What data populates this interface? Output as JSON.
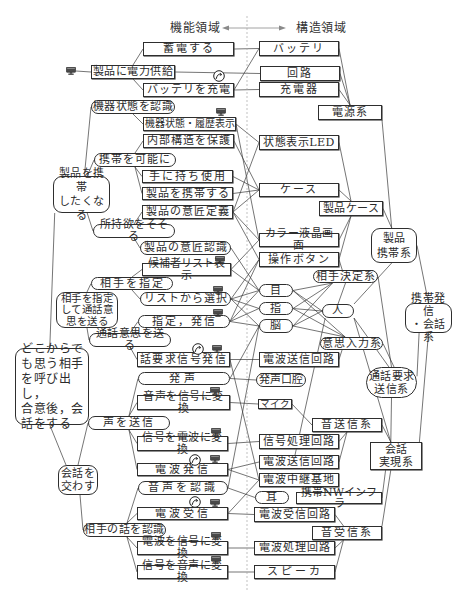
{
  "header": {
    "function_domain": "機能領域",
    "structure_domain": "構造領域"
  },
  "icons": {
    "device_display": "monitor-icon",
    "rotation": "cycle-icon"
  },
  "nodes": {
    "f_power": "製品に電力供給",
    "f_store": "蓄電する",
    "f_charge": "バッテリを充電",
    "f_recognize_state": "機器状態を認識",
    "f_show_state": "機器状態・履歴表示",
    "f_protect": "内部構造を保護",
    "f_portable": "携帯を可能に",
    "f_want_carry": "製品を携帯\nしたくなる",
    "f_hold": "手に持ち使用",
    "f_carry": "製品を携帯する",
    "f_design_def": "製品の意匠定義",
    "f_desire": "所持欲をそそる",
    "f_design_rec": "製品の意匠認識",
    "f_candidate": "候補者リスト表示",
    "f_specify": "相手を指定",
    "f_specify_send": "相手を指定\nして通話意\n思を送る",
    "f_select": "リストから選択",
    "f_dial": "指定，発信",
    "f_send_intent": "通話意思を送る",
    "f_root": "どこからで\nも思う相手\nを呼び出し，\n合意後，会\n話をする",
    "f_call_signal": "話要求信号発信",
    "f_utter": "発声",
    "f_voice_to_signal": "音声を信号に変換",
    "f_send_voice": "声を送信",
    "f_signal_to_wave": "信号を電波に変換",
    "f_converse": "会話を\n交わす",
    "f_emit": "電波発信",
    "f_recog_voice": "音声を認識",
    "f_receive": "電波受信",
    "f_recog_other": "相手の話を認識",
    "f_wave_to_signal": "電波を信号に変換",
    "f_signal_to_voice": "信号を音声に変換",
    "s_battery": "バッテリ",
    "s_circuit": "回路",
    "s_charger": "充電器",
    "s_power_sys": "電源系",
    "s_led": "状態表示LED",
    "s_case": "ケース",
    "s_product_case": "製品ケース",
    "s_portable_sys": "製品\n携帯系",
    "s_lcd": "カラー液晶画面",
    "s_button": "操作ボタン",
    "s_partner_sys": "相手決定系",
    "s_eye": "目",
    "s_call_sys": "携帯発信\n・会話系",
    "s_finger": "指",
    "s_person": "人",
    "s_brain": "脳",
    "s_intent_sys": "意思入力系",
    "s_tx_circuit1": "電波送信回路",
    "s_mouth": "発声口腔",
    "s_request_sys": "通話要求\n送信系",
    "s_mic": "マイク",
    "s_voice_tx_sys": "音送信系",
    "s_signal_proc": "信号処理回路",
    "s_conv_sys": "会話\n実現系",
    "s_tx_circuit2": "電波送信回路",
    "s_relay": "電波中継基地",
    "s_ear": "耳",
    "s_nw_infra": "携帯NWインフラ",
    "s_rx_circuit": "電波受信回路",
    "s_voice_rx_sys": "音受信系",
    "s_wave_proc": "電波処理回路",
    "s_speaker": "スピーカ"
  },
  "edges": [
    [
      "f_power",
      "f_store",
      "t@0.5",
      "l"
    ],
    [
      "f_power",
      "f_charge",
      "b@0.5",
      "l"
    ],
    [
      "f_recognize_state",
      "f_show_state",
      "b@0.5",
      "l"
    ],
    [
      "f_portable",
      "f_protect",
      "t@0.5",
      "l"
    ],
    [
      "f_portable",
      "f_hold",
      "b@0.5",
      "l"
    ],
    [
      "f_portable",
      "f_carry",
      "b@0.5",
      "l"
    ],
    [
      "f_desire",
      "f_design_def",
      "t@0.5",
      "l"
    ],
    [
      "f_desire",
      "f_design_rec",
      "b@0.5",
      "l"
    ],
    [
      "f_want_carry",
      "f_recognize_state",
      "t@0.55",
      "l"
    ],
    [
      "f_want_carry",
      "f_portable",
      "t@0.6",
      "l"
    ],
    [
      "f_want_carry",
      "f_desire",
      "b@0.6",
      "l"
    ],
    [
      "f_want_carry",
      "f_root",
      "b@0.03",
      "t@0.47"
    ],
    [
      "f_specify_send",
      "f_specify",
      "t@0.5",
      "l"
    ],
    [
      "f_specify_send",
      "f_send_intent",
      "b@0.5",
      "l"
    ],
    [
      "f_specify",
      "f_candidate",
      "t@0.5",
      "l"
    ],
    [
      "f_specify",
      "f_select",
      "b@0.5",
      "l"
    ],
    [
      "f_send_intent",
      "f_dial",
      "t@0.5",
      "l"
    ],
    [
      "f_send_intent",
      "f_call_signal",
      "b@0.5",
      "l"
    ],
    [
      "f_root",
      "f_converse",
      "b@0.47",
      "t@0.2"
    ],
    [
      "f_converse",
      "f_send_voice",
      "t@0.5",
      "l"
    ],
    [
      "f_converse",
      "f_recog_other",
      "b@0.55",
      "l"
    ],
    [
      "f_send_voice",
      "f_utter",
      "t@0.5",
      "l"
    ],
    [
      "f_send_voice",
      "f_voice_to_signal",
      "t@0.5",
      "l"
    ],
    [
      "f_send_voice",
      "f_signal_to_wave",
      "b@0.5",
      "l"
    ],
    [
      "f_send_voice",
      "f_emit",
      "b@0.5",
      "l"
    ],
    [
      "f_recog_other",
      "f_recog_voice",
      "t@0.53",
      "l"
    ],
    [
      "f_recog_other",
      "f_receive",
      "t@0.53",
      "l"
    ],
    [
      "f_recog_other",
      "f_wave_to_signal",
      "b@0.53",
      "l"
    ],
    [
      "f_recog_other",
      "f_signal_to_voice",
      "b@0.53",
      "l"
    ],
    [
      "icon_power_monitor",
      "f_power",
      "r",
      "l"
    ],
    [
      "f_store",
      "s_battery"
    ],
    [
      "f_power",
      "s_circuit"
    ],
    [
      "f_charge",
      "s_battery"
    ],
    [
      "f_charge",
      "s_charger"
    ],
    [
      "f_show_state",
      "s_led"
    ],
    [
      "f_show_state",
      "s_lcd"
    ],
    [
      "f_protect",
      "s_case"
    ],
    [
      "f_hold",
      "s_case"
    ],
    [
      "f_carry",
      "s_case"
    ],
    [
      "f_design_def",
      "s_case"
    ],
    [
      "f_design_def",
      "s_led"
    ],
    [
      "f_design_def",
      "s_lcd"
    ],
    [
      "f_design_def",
      "s_button"
    ],
    [
      "f_design_rec",
      "s_eye"
    ],
    [
      "f_candidate",
      "s_lcd"
    ],
    [
      "f_candidate",
      "s_eye"
    ],
    [
      "f_select",
      "s_button"
    ],
    [
      "f_select",
      "s_eye"
    ],
    [
      "f_select",
      "s_finger"
    ],
    [
      "f_select",
      "s_brain"
    ],
    [
      "f_dial",
      "s_button"
    ],
    [
      "f_dial",
      "s_eye"
    ],
    [
      "f_dial",
      "s_finger"
    ],
    [
      "f_dial",
      "s_brain"
    ],
    [
      "f_call_signal",
      "s_tx_circuit1"
    ],
    [
      "f_call_signal",
      "s_relay"
    ],
    [
      "f_utter",
      "s_mouth"
    ],
    [
      "f_utter",
      "s_brain"
    ],
    [
      "f_voice_to_signal",
      "s_mic"
    ],
    [
      "f_signal_to_wave",
      "s_signal_proc"
    ],
    [
      "f_emit",
      "s_tx_circuit2"
    ],
    [
      "f_emit",
      "s_relay"
    ],
    [
      "f_recog_voice",
      "s_ear"
    ],
    [
      "f_recog_voice",
      "s_brain"
    ],
    [
      "f_receive",
      "s_rx_circuit"
    ],
    [
      "f_receive",
      "s_relay"
    ],
    [
      "f_wave_to_signal",
      "s_wave_proc"
    ],
    [
      "f_signal_to_voice",
      "s_speaker"
    ],
    [
      "s_battery",
      "s_power_sys",
      "r",
      "t@0.5"
    ],
    [
      "s_circuit",
      "s_power_sys",
      "r",
      "t@0.5"
    ],
    [
      "s_charger",
      "s_power_sys",
      "r",
      "t@0.5"
    ],
    [
      "s_power_sys",
      "s_portable_sys",
      "r@1",
      "t@0.45"
    ],
    [
      "s_led",
      "s_product_case",
      "r",
      "t@0.5"
    ],
    [
      "s_case",
      "s_product_case",
      "r",
      "t@0.5"
    ],
    [
      "s_lcd",
      "s_product_case",
      "r",
      "b@0.5"
    ],
    [
      "s_button",
      "s_product_case",
      "r",
      "b@0.5"
    ],
    [
      "s_product_case",
      "s_portable_sys",
      "r",
      "t@0.45"
    ],
    [
      "s_button",
      "s_partner_sys",
      "r",
      "t@0.45"
    ],
    [
      "s_eye",
      "s_partner_sys",
      "r",
      "b@0.3"
    ],
    [
      "s_finger",
      "s_partner_sys",
      "r",
      "b@0.3"
    ],
    [
      "s_brain",
      "s_partner_sys",
      "r",
      "b@0.3"
    ],
    [
      "s_eye",
      "s_intent_sys",
      "r",
      "t@0.4"
    ],
    [
      "s_finger",
      "s_intent_sys",
      "r",
      "t@0.4"
    ],
    [
      "s_brain",
      "s_intent_sys",
      "r",
      "t@0.4"
    ],
    [
      "s_eye",
      "s_person",
      "r",
      "l"
    ],
    [
      "s_finger",
      "s_person",
      "r",
      "l"
    ],
    [
      "s_brain",
      "s_person",
      "r",
      "l"
    ],
    [
      "s_person",
      "s_partner_sys",
      "t@0.5",
      "b@0.5"
    ],
    [
      "s_person",
      "s_portable_sys",
      "r@0",
      "b@0.45"
    ],
    [
      "s_person",
      "s_request_sys",
      "r@1",
      "t@0.45"
    ],
    [
      "s_person",
      "s_conv_sys",
      "r@1",
      "t@0.4"
    ],
    [
      "s_person",
      "s_tx_circuit2",
      "b@0.1",
      "t@0.45"
    ],
    [
      "s_partner_sys",
      "s_request_sys",
      "r",
      "t@0.5"
    ],
    [
      "s_intent_sys",
      "s_request_sys",
      "r",
      "t@0.55"
    ],
    [
      "s_tx_circuit1",
      "s_intent_sys",
      "r",
      "b@0.35"
    ],
    [
      "s_portable_sys",
      "s_call_sys",
      "r",
      "t@0.5"
    ],
    [
      "s_request_sys",
      "s_call_sys",
      "r@0.3",
      "b@0.3"
    ],
    [
      "s_request_sys",
      "s_conv_sys",
      "b@0.5",
      "t@0.4"
    ],
    [
      "s_conv_sys",
      "s_call_sys",
      "t@0.95",
      "b@0.5"
    ],
    [
      "s_mic",
      "s_voice_tx_sys",
      "r",
      "l"
    ],
    [
      "s_signal_proc",
      "s_voice_tx_sys",
      "r",
      "b@0.5"
    ],
    [
      "s_tx_circuit2",
      "s_voice_tx_sys",
      "r",
      "b@0.5"
    ],
    [
      "s_voice_tx_sys",
      "s_conv_sys",
      "r",
      "t@0.4"
    ],
    [
      "s_relay",
      "s_nw_infra",
      "b@0.8",
      "t@0.35"
    ],
    [
      "s_nw_infra",
      "s_conv_sys",
      "r",
      "b@0.3"
    ],
    [
      "s_rx_circuit",
      "s_voice_rx_sys",
      "r",
      "t@0.45"
    ],
    [
      "s_wave_proc",
      "s_voice_rx_sys",
      "r",
      "b@0.45"
    ],
    [
      "s_speaker",
      "s_voice_rx_sys",
      "r",
      "b@0.45"
    ],
    [
      "s_voice_rx_sys",
      "s_conv_sys",
      "r@0",
      "b@0.4"
    ]
  ]
}
